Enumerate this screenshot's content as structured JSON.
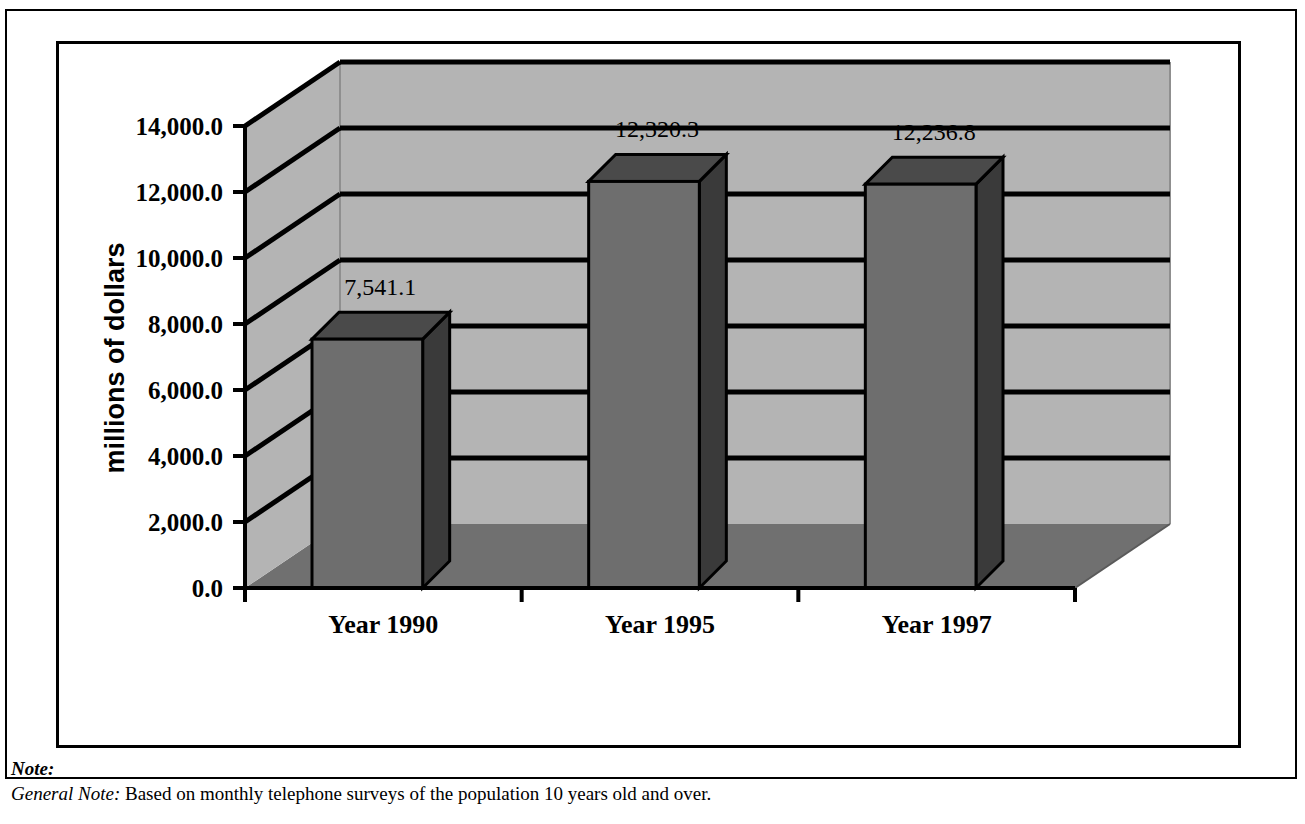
{
  "chart_data": {
    "type": "bar",
    "title": "",
    "subtitle": "",
    "xlabel": "",
    "ylabel": "millions of dollars",
    "categories": [
      "Year 1990",
      "Year 1995",
      "Year 1997"
    ],
    "values": [
      7541.1,
      12320.3,
      12236.8
    ],
    "data_labels": [
      "7,541.1",
      "12,320.3",
      "12,236.8"
    ],
    "ylim": [
      0,
      14000
    ],
    "ytick_values": [
      0,
      2000,
      4000,
      6000,
      8000,
      10000,
      12000,
      14000
    ],
    "ytick_labels": [
      "0.0",
      "2,000.0",
      "4,000.0",
      "6,000.0",
      "8,000.0",
      "10,000.0",
      "12,000.0",
      "14,000.0"
    ],
    "grid": true,
    "grid_axis": "y",
    "legend": false,
    "legend_position": "none",
    "style": "3d-column",
    "colors": {
      "bar_front": "#6e6e6e",
      "bar_side": "#3a3a3a",
      "bar_top": "#4a4a4a",
      "back_wall": "#b4b4b4",
      "side_wall": "#b4b4b4",
      "floor": "#707070",
      "gridline": "#000000",
      "outline": "#000000",
      "background": "#ffffff"
    }
  },
  "notes": {
    "heading": "Note:",
    "general_note_label": "General Note:",
    "general_note_text": "Based on monthly telephone surveys of the population 10 years old and over."
  }
}
